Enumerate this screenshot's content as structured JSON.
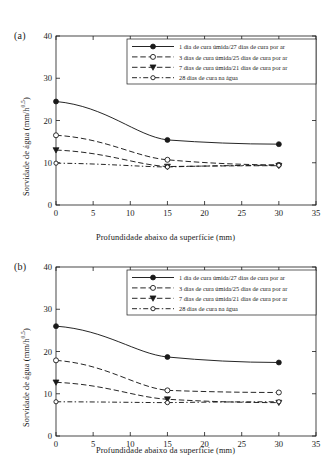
{
  "figure": {
    "panels": [
      {
        "tag": "(a)"
      },
      {
        "tag": "(b)"
      }
    ],
    "axis": {
      "xlabel": "Profundidade abaixo da superfície (mm)",
      "ylabel_main": "Sorvidade de água (mm/h",
      "ylabel_exp": "0,5",
      "ylabel_close": ")",
      "xticks": [
        "0",
        "5",
        "10",
        "15",
        "20",
        "25",
        "30",
        "35"
      ],
      "yticks": [
        "0",
        "10",
        "20",
        "30",
        "40"
      ]
    },
    "legend": {
      "items": [
        "1 dia de cura úmida/27 dias de cura por ar",
        "3 dias de cura úmida/25 dias de cura por ar",
        "7 dias de cura úmida/21 dias de cura por ar",
        "28 dias de cura na água"
      ]
    }
  },
  "chart_data": [
    {
      "type": "line",
      "panel": "(a)",
      "title": "",
      "xlabel": "Profundidade abaixo da superfície (mm)",
      "ylabel": "Sorvidade de água (mm/h^0,5)",
      "xlim": [
        0,
        35
      ],
      "ylim": [
        0,
        40
      ],
      "xticks": [
        0,
        5,
        10,
        15,
        20,
        25,
        30,
        35
      ],
      "yticks": [
        0,
        10,
        20,
        30,
        40
      ],
      "grid": false,
      "legend_position": "upper right",
      "x": [
        0,
        15,
        30
      ],
      "series": [
        {
          "name": "1 dia de cura úmida/27 dias de cura por ar",
          "values": [
            24.5,
            15.4,
            14.4
          ],
          "marker": "filled-circle",
          "line": "solid"
        },
        {
          "name": "3 dias de cura úmida/25 dias de cura por ar",
          "values": [
            16.5,
            10.7,
            9.5
          ],
          "marker": "open-circle",
          "line": "dashed"
        },
        {
          "name": "7 dias de cura úmida/21 dias de cura por ar",
          "values": [
            13.0,
            9.1,
            9.3
          ],
          "marker": "filled-triangle-down",
          "line": "dashed"
        },
        {
          "name": "28 dias de cura na água",
          "values": [
            9.9,
            9.0,
            9.4
          ],
          "marker": "small-open-circle",
          "line": "dash-dot"
        }
      ]
    },
    {
      "type": "line",
      "panel": "(b)",
      "title": "",
      "xlabel": "Profundidade abaixo da superfície (mm)",
      "ylabel": "Sorvidade de água (mm/h^0,5)",
      "xlim": [
        0,
        35
      ],
      "ylim": [
        0,
        40
      ],
      "xticks": [
        0,
        5,
        10,
        15,
        20,
        25,
        30,
        35
      ],
      "yticks": [
        0,
        10,
        20,
        30,
        40
      ],
      "grid": false,
      "legend_position": "upper right",
      "x": [
        0,
        15,
        30
      ],
      "series": [
        {
          "name": "1 dia de cura úmida/27 dias de cura por ar",
          "values": [
            26.0,
            18.7,
            17.4
          ],
          "marker": "filled-circle",
          "line": "solid"
        },
        {
          "name": "3 dias de cura úmida/25 dias de cura por ar",
          "values": [
            17.9,
            10.8,
            10.3
          ],
          "marker": "open-circle",
          "line": "dashed"
        },
        {
          "name": "7 dias de cura úmida/21 dias de cura por ar",
          "values": [
            12.7,
            8.7,
            7.9
          ],
          "marker": "filled-triangle-down",
          "line": "dashed"
        },
        {
          "name": "28 dias de cura na água",
          "values": [
            8.1,
            7.9,
            8.1
          ],
          "marker": "small-open-circle",
          "line": "dash-dot"
        }
      ]
    }
  ]
}
